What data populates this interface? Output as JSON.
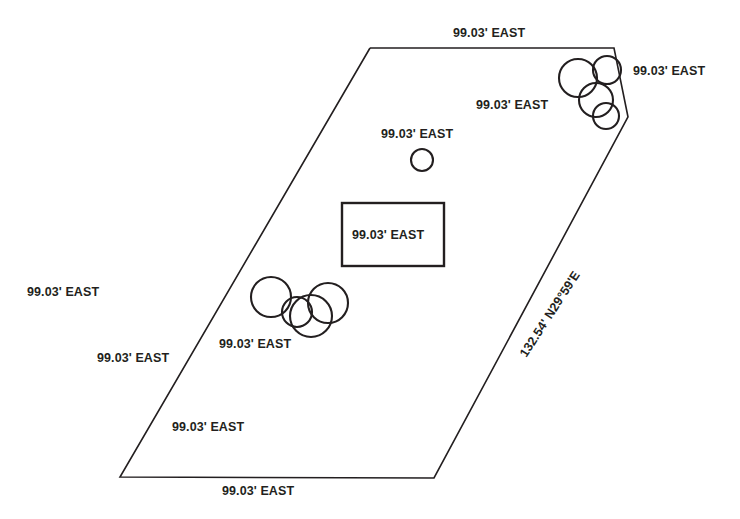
{
  "drawing": {
    "title": "Survey Plat Boundary Sketch",
    "stroke_color": "#231f20",
    "background_color": "#ffffff"
  },
  "labels": [
    {
      "id": "top-boundary",
      "text": "99.03' EAST",
      "x": 453,
      "y": 26,
      "rotation": 0
    },
    {
      "id": "upper-right-outside",
      "text": "99.03' EAST",
      "x": 633,
      "y": 64,
      "rotation": 0
    },
    {
      "id": "upper-right-inside",
      "text": "99.03' EAST",
      "x": 476,
      "y": 98,
      "rotation": 0
    },
    {
      "id": "center-circle",
      "text": "99.03' EAST",
      "x": 381,
      "y": 127,
      "rotation": 0
    },
    {
      "id": "building",
      "text": "99.03' EAST",
      "x": 352,
      "y": 228,
      "rotation": 0
    },
    {
      "id": "left-outside",
      "text": "99.03' EAST",
      "x": 27,
      "y": 285,
      "rotation": 0
    },
    {
      "id": "lower-center-cluster",
      "text": "99.03' EAST",
      "x": 219,
      "y": 337,
      "rotation": 0
    },
    {
      "id": "lower-left-upper",
      "text": "99.03' EAST",
      "x": 97,
      "y": 351,
      "rotation": 0
    },
    {
      "id": "lower-left-lower",
      "text": "99.03' EAST",
      "x": 172,
      "y": 420,
      "rotation": 0
    },
    {
      "id": "bottom-boundary",
      "text": "99.03' EAST",
      "x": 222,
      "y": 484,
      "rotation": 0
    },
    {
      "id": "right-diagonal-bearing",
      "text": "132.54' N29°59'E",
      "x": 517,
      "y": 352,
      "rotation": -57
    }
  ],
  "geometry": {
    "boundary": {
      "name": "parcel-boundary",
      "points": "370,48 614,48 628,117 434,478 120,477 370,48"
    },
    "building": {
      "name": "building-footprint",
      "x": 342,
      "y": 203,
      "width": 102,
      "height": 63
    },
    "circles": [
      {
        "group": "center-marker",
        "cx": 422,
        "cy": 160,
        "r": 11
      },
      {
        "group": "upper-right-tanks",
        "cx": 578,
        "cy": 78,
        "r": 19
      },
      {
        "group": "upper-right-tanks",
        "cx": 607,
        "cy": 70,
        "r": 14
      },
      {
        "group": "upper-right-tanks",
        "cx": 596,
        "cy": 100,
        "r": 17
      },
      {
        "group": "upper-right-tanks",
        "cx": 606,
        "cy": 116,
        "r": 13
      },
      {
        "group": "lower-left-tanks",
        "cx": 271,
        "cy": 297,
        "r": 20
      },
      {
        "group": "lower-left-tanks",
        "cx": 297,
        "cy": 312,
        "r": 15
      },
      {
        "group": "lower-left-tanks",
        "cx": 311,
        "cy": 316,
        "r": 21
      },
      {
        "group": "lower-left-tanks",
        "cx": 328,
        "cy": 303,
        "r": 20
      }
    ]
  }
}
